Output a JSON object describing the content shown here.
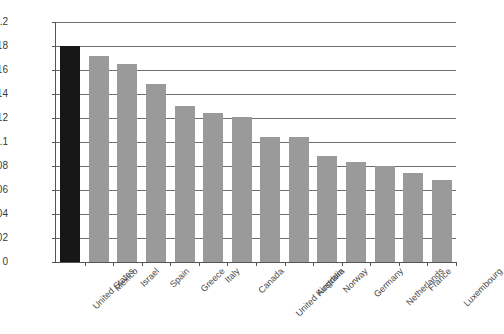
{
  "chart_data": {
    "type": "bar",
    "title": "",
    "subtitle": "",
    "xlabel": "",
    "ylabel": "",
    "ylim": [
      0,
      0.2
    ],
    "ytick_step": 0.02,
    "grid": true,
    "legend": "none",
    "highlight_category": "United States",
    "highlight_color": "#171717",
    "bar_color": "#9a9a9a",
    "axis_color": "#555555",
    "gridline_color": "#6e6e6e",
    "categories": [
      "United States",
      "Mexico",
      "Israel",
      "Spain",
      "Greece",
      "Italy",
      "Canada",
      "United Kingdom",
      "Australia",
      "Norway",
      "Germany",
      "Netherlands",
      "France",
      "Luxembourg"
    ],
    "values": [
      0.18,
      0.172,
      0.165,
      0.148,
      0.13,
      0.124,
      0.121,
      0.104,
      0.104,
      0.088,
      0.083,
      0.08,
      0.074,
      0.068
    ],
    "ytick_labels": [
      "0",
      "0.02",
      "0.04",
      "0.06",
      "0.08",
      "0.1",
      "0.12",
      "0.14",
      "0.16",
      "0.18",
      "0.2"
    ],
    "ytick_values": [
      0,
      0.02,
      0.04,
      0.06,
      0.08,
      0.1,
      0.12,
      0.14,
      0.16,
      0.18,
      0.2
    ]
  }
}
